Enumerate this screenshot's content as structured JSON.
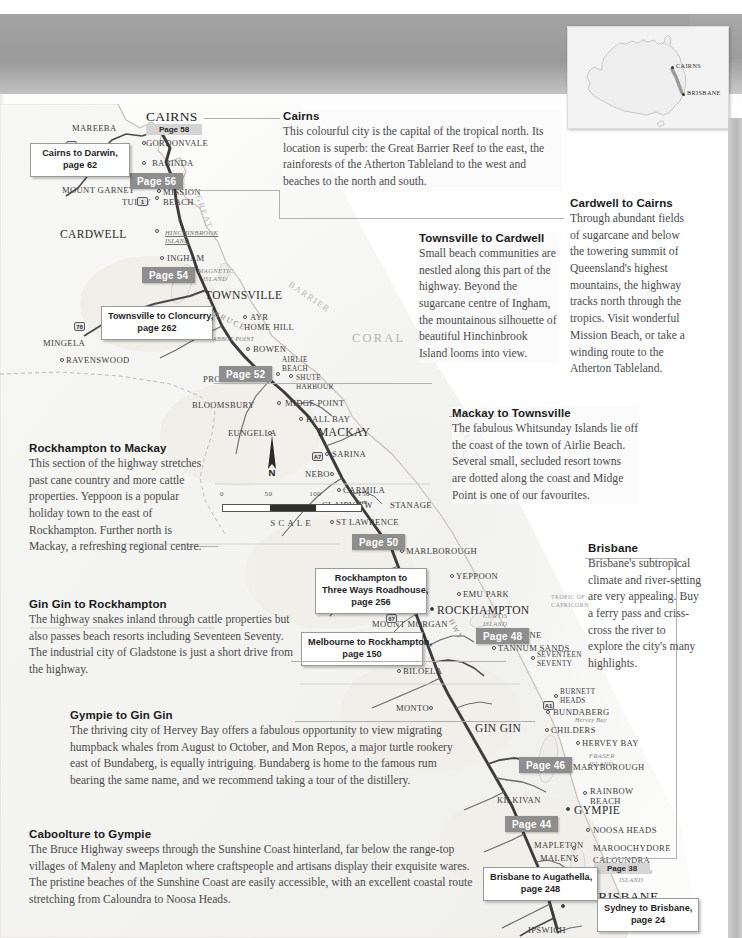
{
  "document": {
    "type": "travel-guide-map-page",
    "title": "Bruce Highway route map – Queensland",
    "region": "Queensland, Australia"
  },
  "inset": {
    "name": "australia-locator-map",
    "markers": [
      {
        "label": "CAIRNS",
        "x": 106,
        "y": 41
      },
      {
        "label": "BRISBANE",
        "x": 118,
        "y": 69
      }
    ]
  },
  "map": {
    "sea_labels": [
      {
        "text": "CORAL",
        "x": 352,
        "y": 228
      },
      {
        "text": "SEA",
        "x": 452,
        "y": 345
      },
      {
        "text": "BARRIER",
        "x": 300,
        "y": 190
      },
      {
        "text": "REEF",
        "x": 462,
        "y": 318
      },
      {
        "text": "GREAT",
        "x": 196,
        "y": 95
      }
    ],
    "tropic_label": "TROPIC OF\nCAPRICORN",
    "scale": {
      "ticks": [
        "0",
        "50",
        "100",
        "150 km"
      ],
      "label": "SCALE"
    },
    "compass_label": "N",
    "highway_name": "BRUCE",
    "highway_name2": "HWY",
    "shields": [
      "1",
      "1",
      "78",
      "A7",
      "67",
      "17",
      "A1"
    ],
    "places": [
      {
        "name": "MAREEBA",
        "style": "md"
      },
      {
        "name": "CAIRNS",
        "style": "xl"
      },
      {
        "name": "GORDONVALE",
        "style": "md"
      },
      {
        "name": "BABINDA",
        "style": "md"
      },
      {
        "name": "MOUNT GARNET",
        "style": "md"
      },
      {
        "name": "TULLY",
        "style": "md"
      },
      {
        "name": "MISSION BEACH",
        "style": "md"
      },
      {
        "name": "CARDWELL",
        "style": "lg"
      },
      {
        "name": "HINCHINBROOK ISLAND",
        "style": "island"
      },
      {
        "name": "INGHAM",
        "style": "md"
      },
      {
        "name": "MAGNETIC ISLAND",
        "style": "islandp"
      },
      {
        "name": "TOWNSVILLE",
        "style": "lg"
      },
      {
        "name": "AYR",
        "style": "md"
      },
      {
        "name": "HOME HILL",
        "style": "md"
      },
      {
        "name": "MINGELA",
        "style": "md"
      },
      {
        "name": "RAVENSWOOD",
        "style": "md"
      },
      {
        "name": "ABBOT POINT",
        "style": "tiny-it"
      },
      {
        "name": "BOWEN",
        "style": "md"
      },
      {
        "name": "AIRLIE BEACH",
        "style": "sm"
      },
      {
        "name": "SHUTE HARBOUR",
        "style": "sm"
      },
      {
        "name": "PROSERPINE",
        "style": "md"
      },
      {
        "name": "BLOOMSBURY",
        "style": "md"
      },
      {
        "name": "MIDGE POINT",
        "style": "md"
      },
      {
        "name": "BALL BAY",
        "style": "md"
      },
      {
        "name": "EUNGELLA",
        "style": "md"
      },
      {
        "name": "MACKAY",
        "style": "lg"
      },
      {
        "name": "SARINA",
        "style": "md"
      },
      {
        "name": "NEBO",
        "style": "md"
      },
      {
        "name": "CARMILA",
        "style": "md"
      },
      {
        "name": "CLAIRVIEW",
        "style": "md"
      },
      {
        "name": "STANAGE",
        "style": "md"
      },
      {
        "name": "ST LAWRENCE",
        "style": "md"
      },
      {
        "name": "MARLBOROUGH",
        "style": "md"
      },
      {
        "name": "YEPPOON",
        "style": "md"
      },
      {
        "name": "EMU PARK",
        "style": "md"
      },
      {
        "name": "ROCKHAMPTON",
        "style": "lg"
      },
      {
        "name": "MOUNT MORGAN",
        "style": "md"
      },
      {
        "name": "CURTIS ISLAND",
        "style": "islandp"
      },
      {
        "name": "GLADSTONE",
        "style": "md"
      },
      {
        "name": "TANNUM SANDS",
        "style": "md"
      },
      {
        "name": "SEVENTEEN SEVENTY",
        "style": "sm"
      },
      {
        "name": "BILOELA",
        "style": "md"
      },
      {
        "name": "MONTO",
        "style": "md"
      },
      {
        "name": "BURNETT HEADS",
        "style": "sm"
      },
      {
        "name": "BUNDABERG",
        "style": "md"
      },
      {
        "name": "HERVEY BAY",
        "style": "md"
      },
      {
        "name": "FRASER ISLAND",
        "style": "islandp"
      },
      {
        "name": "GIN GIN",
        "style": "lg"
      },
      {
        "name": "CHILDERS",
        "style": "md"
      },
      {
        "name": "MARYBOROUGH",
        "style": "md"
      },
      {
        "name": "RAINBOW BEACH",
        "style": "md"
      },
      {
        "name": "KILKIVAN",
        "style": "md"
      },
      {
        "name": "GYMPIE",
        "style": "lg"
      },
      {
        "name": "NOOSA HEADS",
        "style": "md"
      },
      {
        "name": "MAPLETON",
        "style": "md"
      },
      {
        "name": "MAROOCHYDORE",
        "style": "md"
      },
      {
        "name": "MALENY",
        "style": "md"
      },
      {
        "name": "CALOUNDRA",
        "style": "md"
      },
      {
        "name": "CABOOLTURE",
        "style": "lg"
      },
      {
        "name": "MORETON ISLAND",
        "style": "islandp"
      },
      {
        "name": "BRISBANE",
        "style": "xl"
      },
      {
        "name": "IPSWICH",
        "style": "md"
      }
    ],
    "page_chips": [
      {
        "label": "Page 56",
        "x": 130,
        "y": 173
      },
      {
        "label": "Page 54",
        "x": 142,
        "y": 267
      },
      {
        "label": "Page 52",
        "x": 219,
        "y": 366
      },
      {
        "label": "Page 50",
        "x": 352,
        "y": 534
      },
      {
        "label": "Page 48",
        "x": 476,
        "y": 628
      },
      {
        "label": "Page 46",
        "x": 519,
        "y": 757
      },
      {
        "label": "Page 44",
        "x": 505,
        "y": 816
      }
    ],
    "city_chips": [
      {
        "city": "CAIRNS",
        "page": "Page 58"
      },
      {
        "city": "BRISBANE",
        "page": "Page 38"
      }
    ],
    "callouts": [
      {
        "id": "cairns-darwin",
        "text": "Cairns to Darwin,\npage 62",
        "x": 30,
        "y": 143
      },
      {
        "id": "tsv-cloncurry",
        "text": "Townsville to Cloncurry,\npage 262",
        "x": 101,
        "y": 306
      },
      {
        "id": "rock-threeways",
        "text": "Rockhampton to\nThree Ways Roadhouse,\npage 256",
        "x": 315,
        "y": 568
      },
      {
        "id": "melb-rock",
        "text": "Melbourne to Rockhampton,\npage 150",
        "x": 301,
        "y": 632
      },
      {
        "id": "bris-augathella",
        "text": "Brisbane to Augathella,\npage 248",
        "x": 483,
        "y": 867
      },
      {
        "id": "syd-bris",
        "text": "Sydney to Brisbane,\npage 24",
        "x": 597,
        "y": 898
      }
    ]
  },
  "blocks": [
    {
      "id": "cairns",
      "title": "Cairns",
      "body": "This colourful city is the capital of the tropical north. Its location is superb: the Great Barrier Reef to the east, the rainforests of the Atherton Tableland to the west and beaches to the north and south."
    },
    {
      "id": "cardwell-to-cairns",
      "title": "Cardwell to Cairns",
      "body": "Through abundant fields of sugarcane and below the towering summit of Queensland's highest mountains, the highway tracks north through the tropics. Visit wonderful Mission Beach, or take a winding route to the Atherton Tableland."
    },
    {
      "id": "townsville-to-cardwell",
      "title": "Townsville to Cardwell",
      "body": "Small beach communities are nestled along this part of the highway. Beyond the sugarcane centre of Ingham, the mountainous silhouette of beautiful Hinchinbrook Island looms into view."
    },
    {
      "id": "mackay-to-townsville",
      "title": "Mackay to Townsville",
      "body": "The fabulous Whitsunday Islands lie off the coast of the town of Airlie Beach. Several small, secluded resort towns are dotted along the coast and Midge Point is one of our favourites."
    },
    {
      "id": "rockhampton-to-mackay",
      "title": "Rockhampton to Mackay",
      "body": "This section of the highway stretches past cane country and more cattle properties. Yeppoon is a popular holiday town to the east of Rockhampton. Further north is Mackay, a refreshing regional centre."
    },
    {
      "id": "brisbane",
      "title": "Brisbane",
      "body": "Brisbane's subtropical climate and river-setting are very appealing. Buy a ferry pass and criss-cross the river to explore the city's many highlights."
    },
    {
      "id": "gin-gin-to-rockhampton",
      "title": "Gin Gin to Rockhampton",
      "body": "The highway snakes inland through cattle properties but also passes beach resorts including Seventeen Seventy. The industrial city of Gladstone is just a short drive from the highway."
    },
    {
      "id": "gympie-to-gin-gin",
      "title": "Gympie to Gin Gin",
      "body": "The thriving city of Hervey Bay offers a fabulous opportunity to view migrating humpback whales from August to October, and Mon Repos, a major turtle rookery east of Bundaberg, is equally intriguing. Bundaberg is home to the famous rum bearing the same name, and we recommend taking a tour of the distillery."
    },
    {
      "id": "caboolture-to-gympie",
      "title": "Caboolture to Gympie",
      "body": "The Bruce Highway sweeps through the Sunshine Coast hinterland, far below the range-top villages of Maleny and Mapleton where craftspeople and artisans display their exquisite wares. The pristine beaches of the Sunshine Coast are easily accessible, with an excellent coastal route stretching from Caloundra to Noosa Heads."
    }
  ],
  "colors": {
    "header_band": "#9d9d9d",
    "chip_bg": "#8e8e8e",
    "city_chip_bg": "#d4d4d4",
    "land": "#f4f4f2",
    "sea": "#fafafa",
    "road": "#3a3a3a",
    "text_body": "#4a4a4a"
  }
}
